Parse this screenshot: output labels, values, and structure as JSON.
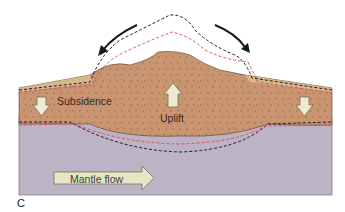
{
  "diagram": {
    "panel_label": "C",
    "labels": {
      "subsidence": "Subsidence",
      "uplift": "Uplift",
      "mantle_flow": "Mantle flow"
    },
    "legend_lines": {
      "black_dashed": "earlier surface/boundary position",
      "red_dashed": "intermediate surface/boundary position"
    },
    "colors": {
      "crust": "#c99470",
      "crust_speckle": "#8a5a3a",
      "sediment": "#dcc08e",
      "mantle": "#bcb3c4",
      "arrow_fill": "#ecead0",
      "arrow_stroke": "#6b6452",
      "black_dash": "#1e1e26",
      "red_dash": "#d8546a",
      "flow_arrow": "#1a1a1a"
    }
  }
}
